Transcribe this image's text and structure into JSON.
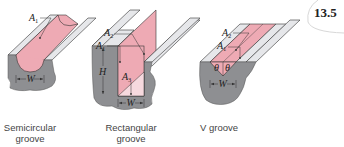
{
  "figure": {
    "number": "13.5",
    "colors": {
      "groove_fill": "#eeaab4",
      "groove_fill_light": "#f6d9de",
      "top_surface": "#e6e7ea",
      "body_gray": "#8e8f92",
      "outline": "#333333"
    },
    "panels": [
      {
        "caption_line1": "Semicircular",
        "caption_line2": "groove",
        "labels": {
          "A1": "A",
          "A1_sub": "1",
          "W": "W"
        }
      },
      {
        "caption_line1": "Rectangular",
        "caption_line2": "groove",
        "labels": {
          "A1": "A",
          "A1_sub": "1",
          "A2": "A",
          "A2_sub": "2",
          "A3": "A",
          "A3_sub": "3",
          "H": "H",
          "W": "W"
        }
      },
      {
        "caption_line1": "V groove",
        "caption_line2": "",
        "labels": {
          "A1": "A",
          "A1_sub": "1",
          "A2": "A",
          "A2_sub": "2",
          "theta_left": "θ",
          "theta_right": "θ",
          "W": "W"
        }
      }
    ]
  }
}
